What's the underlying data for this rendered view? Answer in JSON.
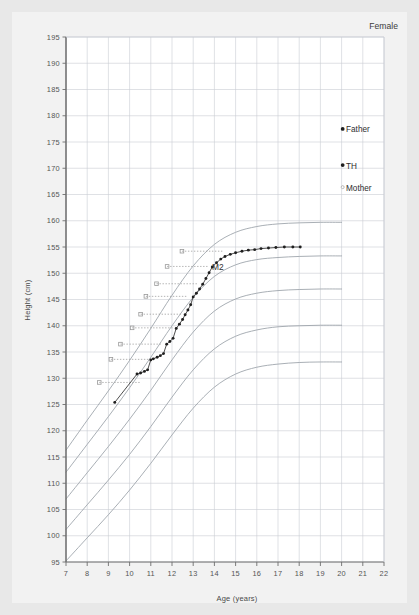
{
  "header": {
    "sex_label": "Female"
  },
  "axes": {
    "x_title": "Age (years)",
    "y_title": "Height (cm)",
    "x_ticks": [
      7,
      8,
      9,
      10,
      11,
      12,
      13,
      14,
      15,
      16,
      17,
      18,
      19,
      20,
      21,
      22
    ],
    "y_ticks": [
      95,
      100,
      105,
      110,
      115,
      120,
      125,
      130,
      135,
      140,
      145,
      150,
      155,
      160,
      165,
      170,
      175,
      180,
      185,
      190,
      195
    ],
    "xlim": [
      7,
      22
    ],
    "ylim": [
      95,
      195
    ]
  },
  "colors": {
    "page_background": "#e8e8e8",
    "card_background": "#f2f2f2",
    "plot_background": "#ffffff",
    "grid": "#c9cdd4",
    "axis": "#6e6e6e",
    "centile_curve": "#9aa0a8",
    "patient_line": "#3a3a3a",
    "patient_marker": "#1f1f1f",
    "annotation_dotted": "#9a9a9a",
    "text": "#444444"
  },
  "parent_markers": [
    {
      "name": "father-marker",
      "label": "Father",
      "age": 20.05,
      "height": 177.5,
      "dot": "filled"
    },
    {
      "name": "target-height-marker",
      "label": "TH",
      "age": 20.05,
      "height": 170.6,
      "dot": "filled"
    },
    {
      "name": "mother-marker",
      "label": "Mother",
      "age": 20.05,
      "height": 166.4,
      "dot": "open"
    }
  ],
  "puberty_annotations": [
    {
      "label": "",
      "age": 10.55,
      "height": 129.2
    },
    {
      "label": "",
      "age": 11.1,
      "height": 133.6
    },
    {
      "label": "",
      "age": 11.55,
      "height": 136.5
    },
    {
      "label": "",
      "age": 12.1,
      "height": 139.6
    },
    {
      "label": "",
      "age": 12.5,
      "height": 142.2
    },
    {
      "label": "",
      "age": 12.75,
      "height": 145.6
    },
    {
      "label": "",
      "age": 13.25,
      "height": 148.0
    },
    {
      "label": "M2",
      "age": 13.75,
      "height": 151.3
    },
    {
      "label": "",
      "age": 14.45,
      "height": 154.2
    }
  ],
  "chart_data": {
    "type": "line",
    "xlabel": "Age (years)",
    "ylabel": "Height (cm)",
    "xlim": [
      7,
      22
    ],
    "ylim": [
      95,
      195
    ],
    "grid": true,
    "legend": "none",
    "series": [
      {
        "name": "Patient height",
        "marker": "filled-circle",
        "points": [
          [
            9.3,
            125.4
          ],
          [
            10.35,
            130.8
          ],
          [
            10.52,
            131.0
          ],
          [
            10.7,
            131.3
          ],
          [
            10.85,
            131.6
          ],
          [
            11.0,
            133.5
          ],
          [
            11.12,
            133.7
          ],
          [
            11.3,
            134.0
          ],
          [
            11.45,
            134.3
          ],
          [
            11.6,
            134.7
          ],
          [
            11.75,
            136.5
          ],
          [
            11.9,
            137.0
          ],
          [
            12.05,
            137.6
          ],
          [
            12.2,
            139.5
          ],
          [
            12.35,
            140.3
          ],
          [
            12.5,
            141.2
          ],
          [
            12.62,
            142.1
          ],
          [
            12.75,
            143.0
          ],
          [
            12.88,
            144.0
          ],
          [
            13.0,
            145.5
          ],
          [
            13.15,
            146.2
          ],
          [
            13.3,
            147.0
          ],
          [
            13.45,
            147.9
          ],
          [
            13.6,
            149.0
          ],
          [
            13.75,
            150.1
          ],
          [
            13.9,
            151.2
          ],
          [
            14.1,
            152.0
          ],
          [
            14.3,
            152.7
          ],
          [
            14.5,
            153.2
          ],
          [
            14.75,
            153.6
          ],
          [
            15.0,
            153.9
          ],
          [
            15.3,
            154.2
          ],
          [
            15.6,
            154.4
          ],
          [
            15.9,
            154.5
          ],
          [
            16.2,
            154.7
          ],
          [
            16.55,
            154.8
          ],
          [
            16.9,
            154.9
          ],
          [
            17.3,
            155.0
          ],
          [
            17.7,
            155.0
          ],
          [
            18.05,
            155.0
          ]
        ]
      },
      {
        "name": "97th centile",
        "marker": "none",
        "points": [
          [
            7.0,
            116.3
          ],
          [
            8.0,
            122.0
          ],
          [
            9.0,
            127.6
          ],
          [
            10.0,
            133.4
          ],
          [
            11.0,
            139.5
          ],
          [
            12.0,
            145.8
          ],
          [
            13.0,
            151.4
          ],
          [
            14.0,
            155.5
          ],
          [
            15.0,
            157.8
          ],
          [
            16.0,
            158.9
          ],
          [
            17.0,
            159.4
          ],
          [
            18.0,
            159.6
          ],
          [
            19.0,
            159.7
          ],
          [
            20.0,
            159.7
          ]
        ]
      },
      {
        "name": "75th centile",
        "marker": "none",
        "points": [
          [
            7.0,
            112.1
          ],
          [
            8.0,
            117.4
          ],
          [
            9.0,
            122.7
          ],
          [
            10.0,
            128.2
          ],
          [
            11.0,
            134.0
          ],
          [
            12.0,
            140.0
          ],
          [
            13.0,
            145.4
          ],
          [
            14.0,
            149.4
          ],
          [
            15.0,
            151.6
          ],
          [
            16.0,
            152.6
          ],
          [
            17.0,
            153.0
          ],
          [
            18.0,
            153.2
          ],
          [
            19.0,
            153.3
          ],
          [
            20.0,
            153.3
          ]
        ]
      },
      {
        "name": "50th centile",
        "marker": "none",
        "points": [
          [
            7.0,
            107.0
          ],
          [
            8.0,
            112.0
          ],
          [
            9.0,
            117.0
          ],
          [
            10.0,
            122.2
          ],
          [
            11.0,
            127.7
          ],
          [
            12.0,
            133.5
          ],
          [
            13.0,
            138.8
          ],
          [
            14.0,
            142.8
          ],
          [
            15.0,
            145.1
          ],
          [
            16.0,
            146.2
          ],
          [
            17.0,
            146.7
          ],
          [
            18.0,
            146.9
          ],
          [
            19.0,
            147.0
          ],
          [
            20.0,
            147.0
          ]
        ]
      },
      {
        "name": "25th centile",
        "marker": "none",
        "points": [
          [
            7.0,
            101.2
          ],
          [
            8.0,
            105.9
          ],
          [
            9.0,
            110.6
          ],
          [
            10.0,
            115.5
          ],
          [
            11.0,
            120.8
          ],
          [
            12.0,
            126.4
          ],
          [
            13.0,
            131.6
          ],
          [
            14.0,
            135.6
          ],
          [
            15.0,
            138.0
          ],
          [
            16.0,
            139.2
          ],
          [
            17.0,
            139.8
          ],
          [
            18.0,
            140.0
          ],
          [
            19.0,
            140.1
          ],
          [
            20.0,
            140.1
          ]
        ]
      },
      {
        "name": "3rd centile",
        "marker": "none",
        "points": [
          [
            7.0,
            95.2
          ],
          [
            8.0,
            99.6
          ],
          [
            9.0,
            104.0
          ],
          [
            10.0,
            108.7
          ],
          [
            11.0,
            113.8
          ],
          [
            12.0,
            119.2
          ],
          [
            13.0,
            124.3
          ],
          [
            14.0,
            128.3
          ],
          [
            15.0,
            130.8
          ],
          [
            16.0,
            132.1
          ],
          [
            17.0,
            132.7
          ],
          [
            18.0,
            133.0
          ],
          [
            19.0,
            133.1
          ],
          [
            20.0,
            133.1
          ]
        ]
      }
    ]
  }
}
